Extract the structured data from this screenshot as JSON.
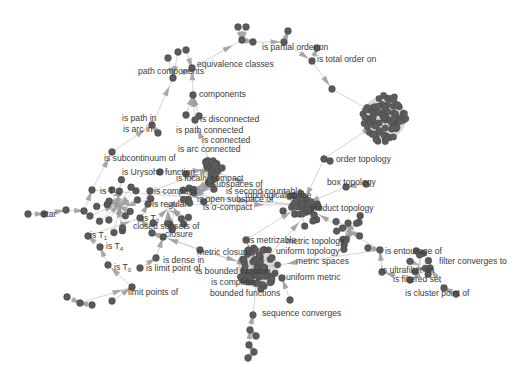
{
  "diagram": {
    "type": "directed-graph",
    "node_color": "#5a5a5a",
    "edge_color": "#cfcfcf",
    "arrow_color": "#9a9a9a",
    "labels": [
      {
        "id": "is_partial_order_on",
        "text": "is partial order on",
        "x": 262,
        "y": 47
      },
      {
        "id": "is_total_order_on",
        "text": "is total order on",
        "x": 317,
        "y": 59
      },
      {
        "id": "equivalence_classes",
        "text": "equivalence classes",
        "x": 197,
        "y": 64
      },
      {
        "id": "path_components",
        "text": "path components",
        "x": 138,
        "y": 71
      },
      {
        "id": "components",
        "text": "components",
        "x": 199,
        "y": 94
      },
      {
        "id": "is_disconnected",
        "text": "is disconnected",
        "x": 200,
        "y": 119
      },
      {
        "id": "is_path_in",
        "text": "is path in",
        "x": 122,
        "y": 118
      },
      {
        "id": "is_arc_in",
        "text": "is arc in",
        "x": 123,
        "y": 129
      },
      {
        "id": "is_path_connected",
        "text": "is path connected",
        "x": 176,
        "y": 130
      },
      {
        "id": "is_connected",
        "text": "is connected",
        "x": 202,
        "y": 140
      },
      {
        "id": "is_arc_connected",
        "text": "is arc connected",
        "x": 178,
        "y": 149
      },
      {
        "id": "is_subcontinuum_of",
        "text": "is subcontinuum of",
        "x": 104,
        "y": 158
      },
      {
        "id": "order_topology",
        "text": "order topology",
        "x": 336,
        "y": 159
      },
      {
        "id": "is_urysohn_function",
        "text": "is Urysohn function",
        "x": 122,
        "y": 172
      },
      {
        "id": "is_locally_compact",
        "text": "is locally compact",
        "x": 176,
        "y": 178
      },
      {
        "id": "subspaces_of",
        "text": "subspaces of",
        "x": 212,
        "y": 184
      },
      {
        "id": "box_topology",
        "text": "box topology",
        "x": 327,
        "y": 182
      },
      {
        "id": "is_second_countable",
        "text": "is second countable",
        "x": 226,
        "y": 191
      },
      {
        "id": "topological_space",
        "text": "topological space",
        "x": 245,
        "y": 195
      },
      {
        "id": "is_T3_5",
        "text": "is T",
        "sub": "3½",
        "x": 100,
        "y": 191
      },
      {
        "id": "is_compact",
        "text": "is compact",
        "x": 154,
        "y": 191
      },
      {
        "id": "is_open_subspace_of",
        "text": "is open subspace of",
        "x": 197,
        "y": 199
      },
      {
        "id": "is_regular",
        "text": "is regular",
        "x": 152,
        "y": 204
      },
      {
        "id": "is_sigma_compact",
        "text": "is σ-compact",
        "x": 203,
        "y": 207
      },
      {
        "id": "product_topology",
        "text": "product topology",
        "x": 310,
        "y": 208
      },
      {
        "id": "star",
        "text": "star",
        "x": 42,
        "y": 214
      },
      {
        "id": "is_T2",
        "text": "is T",
        "sub": "2",
        "x": 142,
        "y": 218
      },
      {
        "id": "closed_subsets_of",
        "text": "closed subsets of",
        "x": 133,
        "y": 226
      },
      {
        "id": "closure",
        "text": "closure",
        "x": 165,
        "y": 234
      },
      {
        "id": "is_T1",
        "text": "is T",
        "sub": "1",
        "x": 90,
        "y": 235
      },
      {
        "id": "is_T4",
        "text": "is T",
        "sub": "4",
        "x": 106,
        "y": 246
      },
      {
        "id": "is_metrizable",
        "text": "is metrizable",
        "x": 248,
        "y": 240
      },
      {
        "id": "metric_topology",
        "text": "metric topology",
        "x": 286,
        "y": 241
      },
      {
        "id": "metric_closure",
        "text": "metric closure",
        "x": 197,
        "y": 252
      },
      {
        "id": "uniform_topology",
        "text": "uniform topology",
        "x": 276,
        "y": 251
      },
      {
        "id": "is_dense_in",
        "text": "is dense in",
        "x": 163,
        "y": 260
      },
      {
        "id": "metric_spaces",
        "text": "metric spaces",
        "x": 296,
        "y": 261
      },
      {
        "id": "is_entourage_of",
        "text": "is entourage of",
        "x": 385,
        "y": 251
      },
      {
        "id": "is_T0",
        "text": "is T",
        "sub": "0",
        "x": 114,
        "y": 267
      },
      {
        "id": "is_limit_point_of",
        "text": "is limit point of",
        "x": 146,
        "y": 268
      },
      {
        "id": "is_bounded_function",
        "text": "is bounded function",
        "x": 196,
        "y": 271
      },
      {
        "id": "filter_converges_to",
        "text": "filter converges to",
        "x": 439,
        "y": 261
      },
      {
        "id": "is_ultrafilter_on",
        "text": "is ultrafilter on",
        "x": 381,
        "y": 270
      },
      {
        "id": "is_filtered_set",
        "text": "is filtered set",
        "x": 393,
        "y": 279
      },
      {
        "id": "uniform_metric",
        "text": "uniform metric",
        "x": 286,
        "y": 277
      },
      {
        "id": "is_complete",
        "text": "is complete",
        "x": 211,
        "y": 282
      },
      {
        "id": "is_cluster_point_of",
        "text": "is cluster point of",
        "x": 405,
        "y": 293
      },
      {
        "id": "limit_points_of",
        "text": "limit points of",
        "x": 128,
        "y": 292
      },
      {
        "id": "bounded_functions",
        "text": "bounded functions",
        "x": 210,
        "y": 293
      },
      {
        "id": "sequence_converges",
        "text": "sequence converges",
        "x": 262,
        "y": 313
      }
    ],
    "clusters": [
      {
        "id": "order-cluster",
        "x": 384,
        "y": 118,
        "r": 22
      },
      {
        "id": "metric-cluster",
        "x": 258,
        "y": 268,
        "r": 20
      },
      {
        "id": "connected-cluster",
        "x": 212,
        "y": 170,
        "r": 10
      },
      {
        "id": "topology-cluster",
        "x": 302,
        "y": 205,
        "r": 11
      }
    ]
  }
}
